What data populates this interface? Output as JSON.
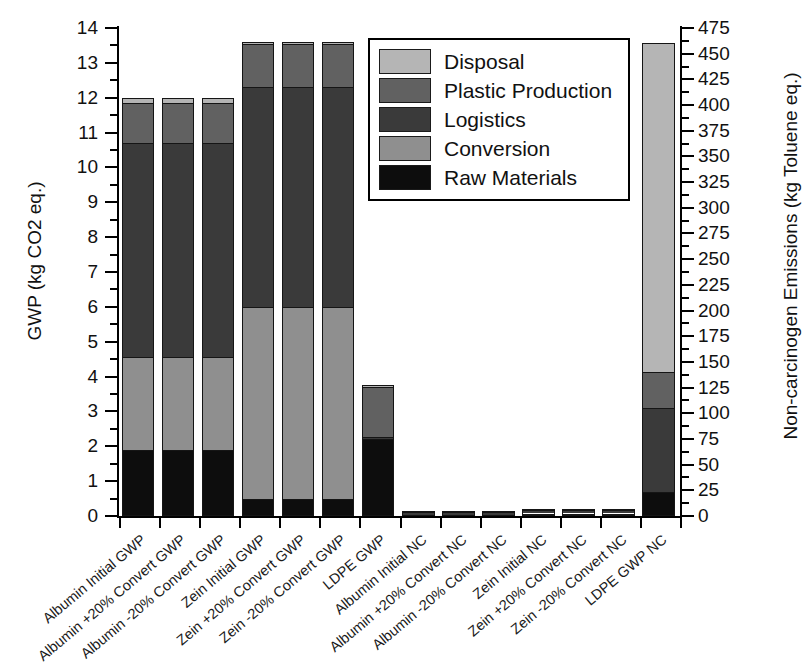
{
  "chart_data": {
    "type": "bar",
    "subtype": "stacked",
    "title": "",
    "xlabel": "",
    "ylabel": "GWP (kg CO2 eq.)",
    "y2label": "Non-carcinogen Emissions (kg Toluene eq.)",
    "ylim": [
      0,
      14
    ],
    "y2lim": [
      0,
      475
    ],
    "yticks": [
      0,
      1,
      2,
      3,
      4,
      5,
      6,
      7,
      8,
      9,
      10,
      11,
      12,
      13,
      14
    ],
    "y2ticks": [
      0,
      25,
      50,
      75,
      100,
      125,
      150,
      175,
      200,
      225,
      250,
      275,
      300,
      325,
      350,
      375,
      400,
      425,
      450,
      475
    ],
    "grid": false,
    "legend_position": "upper-center",
    "legend": [
      "Disposal",
      "Plastic Production",
      "Logistics",
      "Conversion",
      "Raw Materials"
    ],
    "colors": {
      "Disposal": "#b5b5b5",
      "Plastic Production": "#616161",
      "Logistics": "#3a3a3a",
      "Conversion": "#8f8f8f",
      "Raw Materials": "#0d0d0d"
    },
    "categories": [
      "Albumin Initial GWP",
      "Albumin +20% Convert GWP",
      "Albumin -20% Convert GWP",
      "Zein Initial GWP",
      "Zein +20% Convert GWP",
      "Zein -20% Convert GWP",
      "LDPE GWP",
      "Albumin Initial NC",
      "Albumin +20% Convert NC",
      "Albumin -20% Convert NC",
      "Zein Initial NC",
      "Zein +20% Convert NC",
      "Zein -20% Convert NC",
      "LDPE GWP NC"
    ],
    "axis_assignment": [
      "left",
      "left",
      "left",
      "left",
      "left",
      "left",
      "left",
      "right",
      "right",
      "right",
      "right",
      "right",
      "right",
      "right"
    ],
    "series": [
      {
        "name": "Raw Materials",
        "values": [
          1.9,
          1.9,
          1.9,
          0.5,
          0.5,
          0.5,
          2.2,
          0.06,
          0.06,
          0.06,
          0.07,
          0.07,
          0.07,
          23.0
        ]
      },
      {
        "name": "Conversion",
        "values": [
          2.65,
          2.65,
          2.65,
          5.5,
          5.5,
          5.5,
          0.0,
          0.57,
          0.57,
          0.57,
          2.38,
          2.38,
          2.38,
          0.0
        ]
      },
      {
        "name": "Logistics",
        "values": [
          6.15,
          6.15,
          6.15,
          6.3,
          6.3,
          6.3,
          0.08,
          2.87,
          2.87,
          2.87,
          3.15,
          3.15,
          3.15,
          82.0
        ]
      },
      {
        "name": "Plastic Production",
        "values": [
          1.15,
          1.15,
          1.15,
          1.25,
          1.25,
          1.25,
          1.42,
          0.59,
          0.59,
          0.59,
          0.93,
          0.93,
          0.93,
          35.0
        ]
      },
      {
        "name": "Disposal",
        "values": [
          0.15,
          0.15,
          0.15,
          0.05,
          0.05,
          0.05,
          0.05,
          0.0,
          0.0,
          0.0,
          0.0,
          0.0,
          0.0,
          320.0
        ]
      }
    ],
    "totals": [
      12.0,
      12.0,
      12.0,
      13.6,
      13.6,
      13.6,
      3.75,
      4.09,
      4.09,
      4.09,
      6.53,
      6.53,
      6.53,
      460.0
    ]
  },
  "legend": {
    "items": [
      {
        "label": "Disposal",
        "color": "#b5b5b5"
      },
      {
        "label": "Plastic Production",
        "color": "#616161"
      },
      {
        "label": "Logistics",
        "color": "#3a3a3a"
      },
      {
        "label": "Conversion",
        "color": "#8f8f8f"
      },
      {
        "label": "Raw Materials",
        "color": "#0d0d0d"
      }
    ]
  },
  "axes": {
    "left_title": "GWP (kg CO2 eq.)",
    "right_title": "Non-carcinogen Emissions (kg Toluene eq.)",
    "left_ticks": [
      "0",
      "1",
      "2",
      "3",
      "4",
      "5",
      "6",
      "7",
      "8",
      "9",
      "10",
      "11",
      "12",
      "13",
      "14"
    ],
    "right_ticks": [
      "0",
      "25",
      "50",
      "75",
      "100",
      "125",
      "150",
      "175",
      "200",
      "225",
      "250",
      "275",
      "300",
      "325",
      "350",
      "375",
      "400",
      "425",
      "450",
      "475"
    ]
  }
}
